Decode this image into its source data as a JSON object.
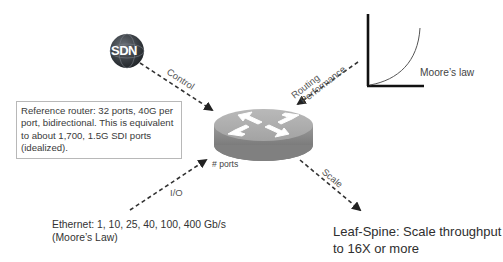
{
  "diagram": {
    "nodes": {
      "sdn": {
        "label": "SDN",
        "icon": "globe-icon"
      },
      "router": {
        "icon": "router-icon",
        "ports_label": "# ports"
      },
      "moores_chart": {
        "label": "Moore’s law",
        "icon": "exponential-curve-icon"
      }
    },
    "edges": {
      "control": "Control",
      "routing_performance_line1": "Routing",
      "routing_performance_line2": "Performance",
      "io": "I/O",
      "scale": "Scale"
    },
    "reference_box": {
      "text": "Reference router: 32 ports, 40G per port, bidirectional. This is equivalent to about 1,700, 1.5G SDI ports (idealized)."
    },
    "ethernet": {
      "line1": "Ethernet: 1, 10, 25, 40, 100, 400 Gb/s",
      "line2": "(Moore’s Law)"
    },
    "leaf_spine": {
      "line1": "Leaf-Spine: Scale throughput",
      "line2": "to 16X or more"
    },
    "colors": {
      "router_top": "#a9a9a9",
      "router_side": "#8a8a8a",
      "arrow": "#333333",
      "sdn_globe": "#3a3f44"
    }
  }
}
